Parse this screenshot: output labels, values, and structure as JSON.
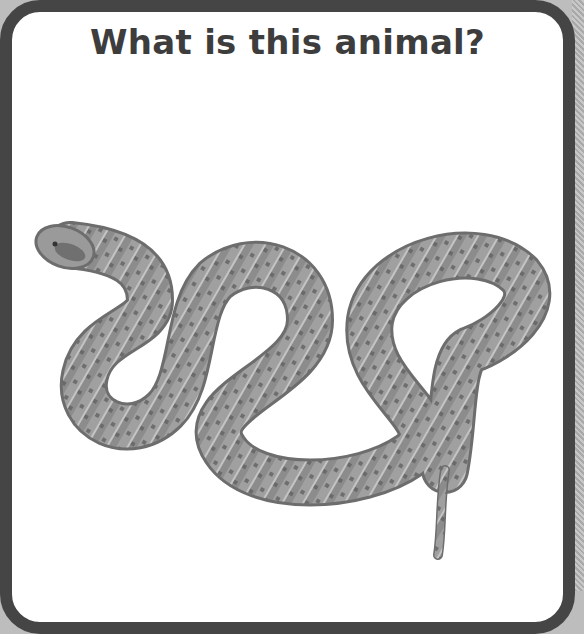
{
  "card": {
    "title": "What is this animal?",
    "image": {
      "subject": "rattlesnake",
      "icon": "snake-illustration"
    }
  },
  "colors": {
    "border": "#454545",
    "background": "#ffffff",
    "title_text": "#3d3d3d",
    "snake_base": "#8a8a8a"
  }
}
